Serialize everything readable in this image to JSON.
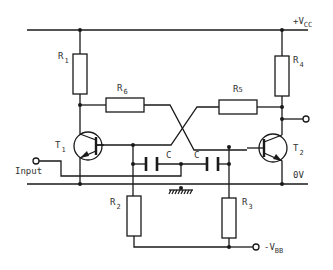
{
  "diagram": {
    "type": "circuit-schematic",
    "rails": {
      "vcc": {
        "prefix": "+V",
        "sub": "CC"
      },
      "zero": {
        "label": "0V"
      },
      "vbb": {
        "prefix": "-V",
        "sub": "BB"
      }
    },
    "resistors": [
      {
        "id": "R1",
        "prefix": "R",
        "sub": "1"
      },
      {
        "id": "R2",
        "prefix": "R",
        "sub": "2"
      },
      {
        "id": "R3",
        "prefix": "R",
        "sub": "3"
      },
      {
        "id": "R4",
        "prefix": "R",
        "sub": "4"
      },
      {
        "id": "R5",
        "prefix": "R",
        "sub": "5"
      },
      {
        "id": "R6",
        "prefix": "R",
        "sub": "6"
      }
    ],
    "transistors": [
      {
        "id": "T1",
        "prefix": "T",
        "sub": "1"
      },
      {
        "id": "T2",
        "prefix": "T",
        "sub": "2"
      }
    ],
    "capacitors": [
      {
        "id": "C-left",
        "label": "C"
      },
      {
        "id": "C-right",
        "label": "C"
      }
    ],
    "input": {
      "label": "Input"
    },
    "stroke_color": "#1a1a1a",
    "background": "#ffffff"
  }
}
